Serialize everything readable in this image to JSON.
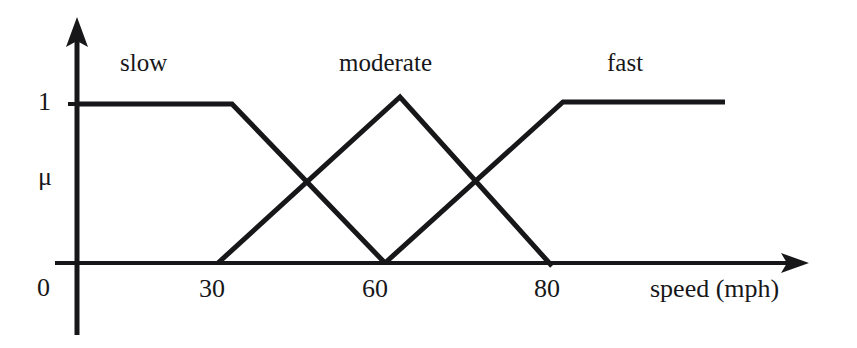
{
  "figure": {
    "background_color": "#ffffff",
    "ink_color": "#17171a",
    "kind": "fuzzy-membership-function-diagram"
  },
  "axes": {
    "y_axis": {
      "name": "mu-axis",
      "top_value_label": "1",
      "zero_label": "0",
      "symbol_label": "μ"
    },
    "x_axis": {
      "name": "speed-axis",
      "title": "speed (mph)",
      "tick_labels": [
        "30",
        "60",
        "80"
      ]
    }
  },
  "set_labels": [
    {
      "id": "slow",
      "text": "slow"
    },
    {
      "id": "moderate",
      "text": "moderate"
    },
    {
      "id": "fast",
      "text": "fast"
    }
  ],
  "chart_data": {
    "type": "line",
    "title": "",
    "xlabel": "speed (mph)",
    "ylabel": "μ",
    "xlim": [
      0,
      100
    ],
    "ylim": [
      0,
      1
    ],
    "grid": false,
    "legend": "inline-labels-above-curves",
    "x_ticks": [
      30,
      60,
      80
    ],
    "y_ticks": [
      0,
      1
    ],
    "y_tick_labels": [
      "0",
      "1"
    ],
    "series": [
      {
        "name": "slow",
        "shape": "trapezoid",
        "x": [
          0,
          30,
          60
        ],
        "values": [
          1,
          1,
          0
        ]
      },
      {
        "name": "moderate",
        "shape": "triangle",
        "x": [
          27,
          62,
          80
        ],
        "values": [
          0,
          1,
          0
        ]
      },
      {
        "name": "fast",
        "shape": "trapezoid",
        "x": [
          60,
          82,
          100
        ],
        "values": [
          0,
          1,
          1
        ]
      }
    ]
  },
  "geometry": {
    "mu_one_y": 103,
    "mu_zero_y": 263,
    "y_axis_x": 77,
    "slow": {
      "points": "78,104 232,104 385,263"
    },
    "moderate": {
      "points": "218,263 400,97 552,266"
    },
    "fast": {
      "points": "385,263 563,102 725,102"
    }
  }
}
